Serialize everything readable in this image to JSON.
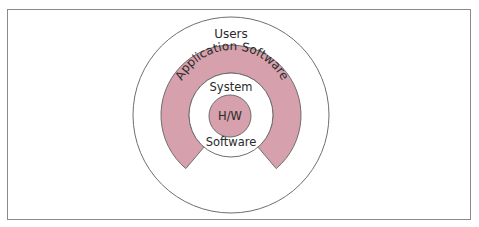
{
  "diagram": {
    "layers": {
      "outer": {
        "label": "Users"
      },
      "ring": {
        "label": "Application Software"
      },
      "inner_top": {
        "label": "System"
      },
      "inner_bottom": {
        "label": "Software"
      },
      "core": {
        "label": "H/W"
      }
    },
    "colors": {
      "ring_fill": "#d6a0ac",
      "core_fill": "#d6a0ac",
      "stroke": "#6e6e6e",
      "frame": "#8a8a8a",
      "text": "#2a2a2a"
    }
  }
}
